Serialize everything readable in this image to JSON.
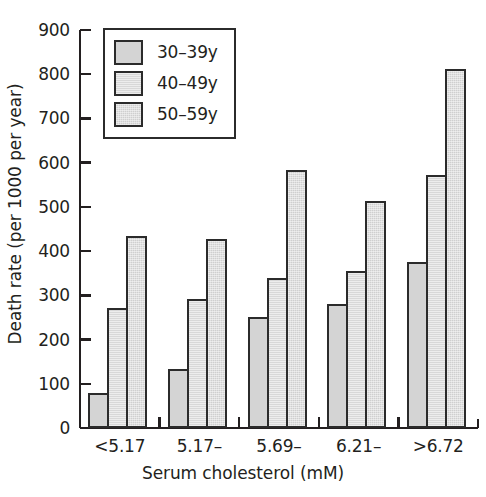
{
  "chart_data": {
    "type": "bar",
    "title": "",
    "xlabel": "Serum cholesterol (mM)",
    "ylabel": "Death rate (per 1000 per year)",
    "categories": [
      "<5.17",
      "5.17–",
      "5.69–",
      "6.21–",
      ">6.72"
    ],
    "series": [
      {
        "name": "30–39y",
        "values": [
          80,
          133,
          250,
          281,
          376
        ]
      },
      {
        "name": "40–49y",
        "values": [
          271,
          292,
          340,
          355,
          573
        ]
      },
      {
        "name": "50–59y",
        "values": [
          434,
          428,
          584,
          514,
          811
        ]
      }
    ],
    "ylim": [
      0,
      900
    ],
    "ytick_values": [
      0,
      100,
      200,
      300,
      400,
      500,
      600,
      700,
      800,
      900
    ],
    "ytick_labels": [
      "0",
      "100",
      "200",
      "300",
      "400",
      "500",
      "600",
      "700",
      "800",
      "900"
    ],
    "grid": false,
    "legend_position": "upper left",
    "bar_fill_color": "#d2d2d2",
    "bar_border_color": "#2b2b2b",
    "axis_color": "#231f20",
    "text_color": "#231f20"
  },
  "legend": {
    "items": [
      {
        "label": "30–39y"
      },
      {
        "label": "40–49y"
      },
      {
        "label": "50–59y"
      }
    ]
  }
}
